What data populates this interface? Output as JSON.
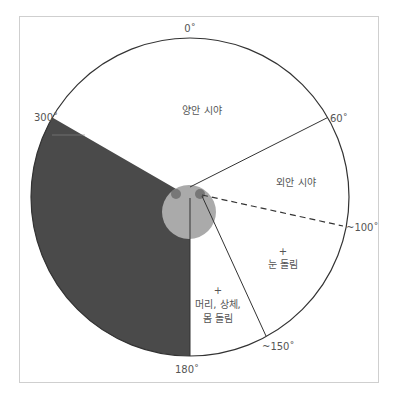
{
  "diagram": {
    "title": "",
    "frame": {
      "x": 19,
      "y": 16,
      "w": 359,
      "h": 366,
      "stroke": "#c8c8c8"
    },
    "circle": {
      "cx": 190,
      "cy": 197,
      "r": 159,
      "stroke": "#333333"
    },
    "head": {
      "cx": 189,
      "cy": 212,
      "r": 27,
      "fill": "#aaaaaa"
    },
    "eyes": [
      {
        "name": "left-eye",
        "cx": 176,
        "cy": 194,
        "r": 5,
        "fill": "#777777"
      },
      {
        "name": "right-eye",
        "cx": 200,
        "cy": 194,
        "r": 5,
        "fill": "#777777"
      }
    ],
    "blind_sector": {
      "from_deg": 180,
      "to_deg": 300,
      "fill": "#4a4a4a"
    },
    "colors": {
      "blind": "#4a4a4a",
      "head": "#aaaaaa",
      "line": "#333333",
      "text": "#555555"
    },
    "angle_labels": {
      "deg0": "0˚",
      "deg60": "60˚",
      "deg100": "~100˚",
      "deg150": "~150˚",
      "deg180": "180˚",
      "deg300": "300˚"
    },
    "regions": {
      "binocular": "양안 시야",
      "monocular": "외안 시야",
      "eye_turn_plus": "+",
      "eye_turn": "눈 돌림",
      "body_turn_plus": "+",
      "body_turn_line1": "머리, 상체,",
      "body_turn_line2": "몸 돌림"
    }
  }
}
